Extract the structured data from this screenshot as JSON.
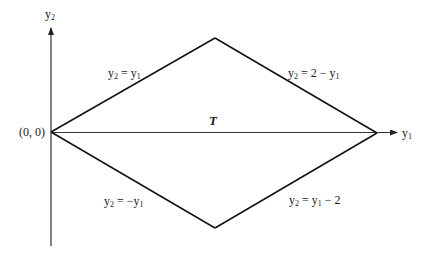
{
  "diagram": {
    "colors": {
      "stroke": "#111111",
      "axis": "#333333",
      "text": "#1a1a1a",
      "background": "#ffffff"
    },
    "axes": {
      "x_label_base": "y",
      "x_label_sub": "1",
      "y_label_base": "y",
      "y_label_sub": "2"
    },
    "origin_label": "(0, 0)",
    "region_label": "T",
    "edges": [
      {
        "id": "upper-left",
        "lhs_base": "y",
        "lhs_sub": "2",
        "rhs_pre": " = ",
        "rhs_var": "y",
        "rhs_sub": "1",
        "rhs_post": ""
      },
      {
        "id": "upper-right",
        "lhs_base": "y",
        "lhs_sub": "2",
        "rhs_pre": " = 2 − ",
        "rhs_var": "y",
        "rhs_sub": "1",
        "rhs_post": ""
      },
      {
        "id": "lower-left",
        "lhs_base": "y",
        "lhs_sub": "2",
        "rhs_pre": " = −",
        "rhs_var": "y",
        "rhs_sub": "1",
        "rhs_post": ""
      },
      {
        "id": "lower-right",
        "lhs_base": "y",
        "lhs_sub": "2",
        "rhs_pre": " =  ",
        "rhs_var": "y",
        "rhs_sub": "1",
        "rhs_post": " − 2"
      }
    ],
    "vertices": [
      {
        "name": "origin",
        "x": 0,
        "y": 0
      },
      {
        "name": "top",
        "x": 1,
        "y": 1
      },
      {
        "name": "right",
        "x": 2,
        "y": 0
      },
      {
        "name": "bottom",
        "x": 1,
        "y": -1
      }
    ]
  }
}
